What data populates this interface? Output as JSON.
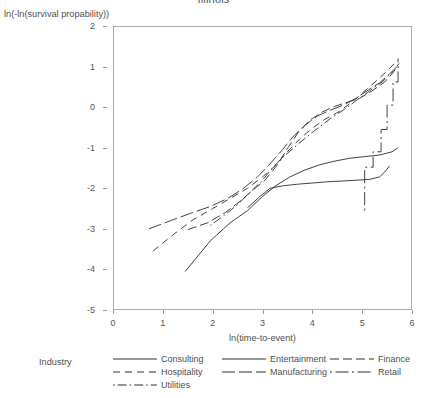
{
  "chart_data": {
    "type": "line",
    "title": "Illinois",
    "xlabel": "ln(time-to-event)",
    "ylabel": "ln(-ln(survival propability))",
    "xlim": [
      0,
      6
    ],
    "ylim": [
      -5,
      2
    ],
    "xticks": [
      0,
      1,
      2,
      3,
      4,
      5,
      6
    ],
    "yticks": [
      2,
      1,
      0,
      -1,
      -2,
      -3,
      -4,
      -5
    ],
    "xtick_labels": [
      "0",
      "1",
      "2",
      "3",
      "4",
      "5",
      "6"
    ],
    "ytick_labels": [
      "2",
      "1",
      "0",
      "-1",
      "-2",
      "-3",
      "-4",
      "-5"
    ],
    "grid": false,
    "legend_position": "bottom",
    "legend_title": "Industry",
    "series": [
      {
        "name": "Consulting",
        "dash": "solid",
        "points": [
          [
            1.45,
            -4.05
          ],
          [
            1.95,
            -3.3
          ],
          [
            2.35,
            -2.85
          ],
          [
            2.7,
            -2.55
          ],
          [
            3.0,
            -2.2
          ],
          [
            3.25,
            -1.95
          ],
          [
            3.55,
            -1.72
          ],
          [
            3.85,
            -1.55
          ],
          [
            4.15,
            -1.42
          ],
          [
            4.45,
            -1.33
          ],
          [
            4.75,
            -1.26
          ],
          [
            5.05,
            -1.22
          ],
          [
            5.35,
            -1.18
          ],
          [
            5.6,
            -1.1
          ],
          [
            5.72,
            -1.0
          ]
        ]
      },
      {
        "name": "Hospitality",
        "dash": "dashed",
        "points": [
          [
            0.8,
            -3.55
          ],
          [
            1.2,
            -3.15
          ],
          [
            1.6,
            -2.78
          ],
          [
            2.0,
            -2.5
          ],
          [
            2.35,
            -2.25
          ],
          [
            2.7,
            -2.0
          ],
          [
            3.0,
            -1.72
          ],
          [
            3.25,
            -1.45
          ],
          [
            3.5,
            -1.1
          ],
          [
            3.75,
            -0.78
          ],
          [
            4.0,
            -0.52
          ],
          [
            4.25,
            -0.3
          ],
          [
            4.55,
            -0.1
          ],
          [
            4.85,
            0.18
          ],
          [
            5.1,
            0.45
          ],
          [
            5.35,
            0.72
          ],
          [
            5.55,
            0.95
          ],
          [
            5.7,
            1.15
          ]
        ]
      },
      {
        "name": "Utilities",
        "dash": "dashdot",
        "points": [
          [
            1.95,
            -2.92
          ],
          [
            2.25,
            -2.65
          ],
          [
            2.5,
            -2.4
          ],
          [
            2.75,
            -2.1
          ],
          [
            3.0,
            -1.8
          ],
          [
            3.2,
            -1.5
          ],
          [
            3.42,
            -1.22
          ],
          [
            3.65,
            -0.98
          ],
          [
            3.9,
            -0.72
          ],
          [
            4.15,
            -0.48
          ],
          [
            4.4,
            -0.25
          ],
          [
            4.65,
            -0.05
          ],
          [
            4.9,
            0.18
          ],
          [
            5.15,
            0.4
          ],
          [
            5.4,
            0.62
          ],
          [
            5.62,
            0.88
          ]
        ]
      },
      {
        "name": "Entertainment",
        "dash": "solid",
        "points": [
          [
            2.7,
            -2.48
          ],
          [
            2.95,
            -2.2
          ],
          [
            3.15,
            -2.0
          ],
          [
            3.4,
            -1.94
          ],
          [
            3.7,
            -1.9
          ],
          [
            4.0,
            -1.87
          ],
          [
            4.3,
            -1.84
          ],
          [
            4.62,
            -1.82
          ],
          [
            4.9,
            -1.8
          ],
          [
            5.15,
            -1.78
          ],
          [
            5.35,
            -1.72
          ],
          [
            5.45,
            -1.6
          ],
          [
            5.55,
            -1.45
          ]
        ]
      },
      {
        "name": "Manufacturing",
        "dash": "longdash",
        "points": [
          [
            0.72,
            -3.0
          ],
          [
            1.15,
            -2.8
          ],
          [
            1.55,
            -2.62
          ],
          [
            1.95,
            -2.45
          ],
          [
            2.3,
            -2.25
          ],
          [
            2.6,
            -2.02
          ],
          [
            2.9,
            -1.72
          ],
          [
            3.15,
            -1.4
          ],
          [
            3.4,
            -1.05
          ],
          [
            3.62,
            -0.72
          ],
          [
            3.85,
            -0.45
          ],
          [
            4.1,
            -0.22
          ],
          [
            4.35,
            -0.08
          ],
          [
            4.62,
            0.05
          ],
          [
            4.88,
            0.22
          ],
          [
            5.12,
            0.42
          ],
          [
            5.35,
            0.6
          ],
          [
            5.55,
            0.82
          ],
          [
            5.7,
            1.0
          ]
        ]
      },
      {
        "name": "Finance",
        "dash": "mediumdash",
        "points": [
          [
            1.5,
            -3.02
          ],
          [
            1.9,
            -2.85
          ],
          [
            2.25,
            -2.6
          ],
          [
            2.55,
            -2.32
          ],
          [
            2.8,
            -2.05
          ],
          [
            3.05,
            -1.8
          ],
          [
            3.3,
            -1.42
          ],
          [
            3.5,
            -1.02
          ],
          [
            3.72,
            -0.62
          ],
          [
            3.95,
            -0.32
          ],
          [
            4.2,
            -0.12
          ],
          [
            4.45,
            0.02
          ],
          [
            4.7,
            0.12
          ],
          [
            4.95,
            0.22
          ],
          [
            5.2,
            0.4
          ],
          [
            5.45,
            0.62
          ],
          [
            5.62,
            0.85
          ],
          [
            5.74,
            1.08
          ]
        ]
      },
      {
        "name": "Retail",
        "dash": "dashdot-long",
        "points": [
          [
            5.05,
            -2.55
          ],
          [
            5.05,
            -1.48
          ],
          [
            5.22,
            -1.48
          ],
          [
            5.22,
            -1.1
          ],
          [
            5.38,
            -1.1
          ],
          [
            5.38,
            -0.55
          ],
          [
            5.5,
            -0.55
          ],
          [
            5.5,
            0.05
          ],
          [
            5.62,
            0.05
          ],
          [
            5.62,
            0.62
          ],
          [
            5.72,
            0.62
          ],
          [
            5.72,
            1.2
          ]
        ]
      }
    ],
    "colors": {
      "line": "#2e2e2e",
      "axis": "#9a9a9a",
      "text": "#4f4f4f",
      "background": "#ffffff"
    }
  },
  "legend": {
    "title": "Industry",
    "columns": [
      [
        {
          "label": "Consulting",
          "dash": "solid"
        },
        {
          "label": "Hospitality",
          "dash": "dashed"
        },
        {
          "label": "Utilities",
          "dash": "dashdot"
        }
      ],
      [
        {
          "label": "Entertainment",
          "dash": "solid"
        },
        {
          "label": "Manufacturing",
          "dash": "longdash"
        }
      ],
      [
        {
          "label": "Finance",
          "dash": "mediumdash"
        },
        {
          "label": "Retail",
          "dash": "dashdot-long"
        }
      ]
    ]
  }
}
